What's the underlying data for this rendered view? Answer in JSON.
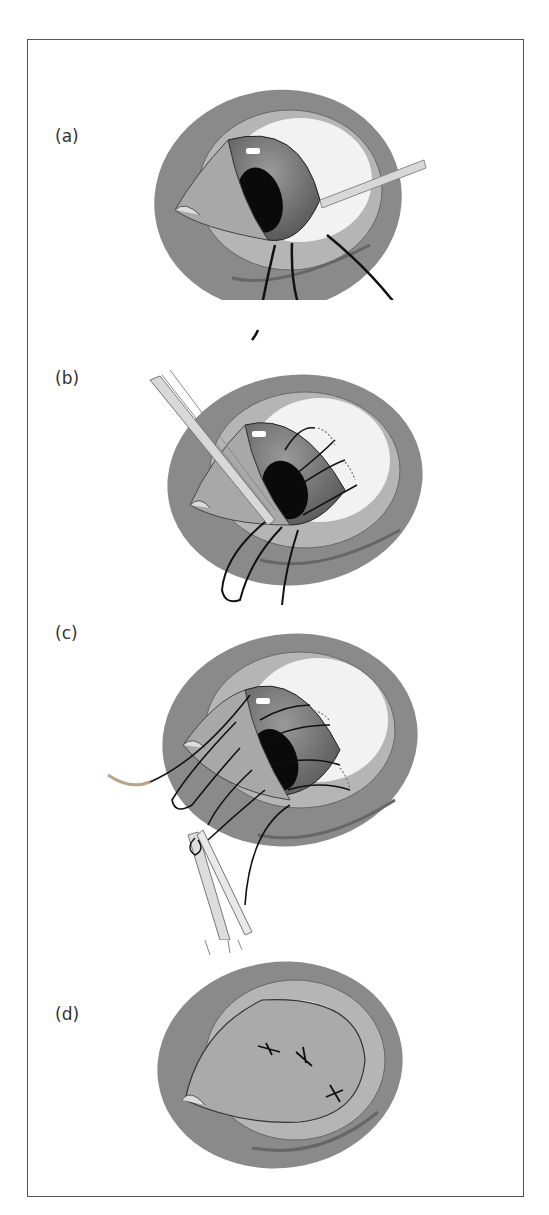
{
  "figure": {
    "panels": [
      {
        "id": "a",
        "label": "(a)",
        "description": "Eyelid everted with forceps/hook retracting, sutures placed through lower tarsus"
      },
      {
        "id": "b",
        "label": "(b)",
        "description": "Forceps grasping conjunctiva, multiple sutures passed through eyelid margin"
      },
      {
        "id": "c",
        "label": "(c)",
        "description": "Needle drawing sutures through lid; forceps holding suture loop"
      },
      {
        "id": "d",
        "label": "(d)",
        "description": "Closed lid with three tied sutures (X marks)"
      }
    ],
    "colors": {
      "outer": "#8a8a8a",
      "lid": "#b5b5b5",
      "sclera": "#f2f2f2",
      "iris": "#6e6e6e",
      "pupil": "#0a0a0a",
      "suture": "#111111",
      "instrument": "#d8d8d8"
    }
  }
}
